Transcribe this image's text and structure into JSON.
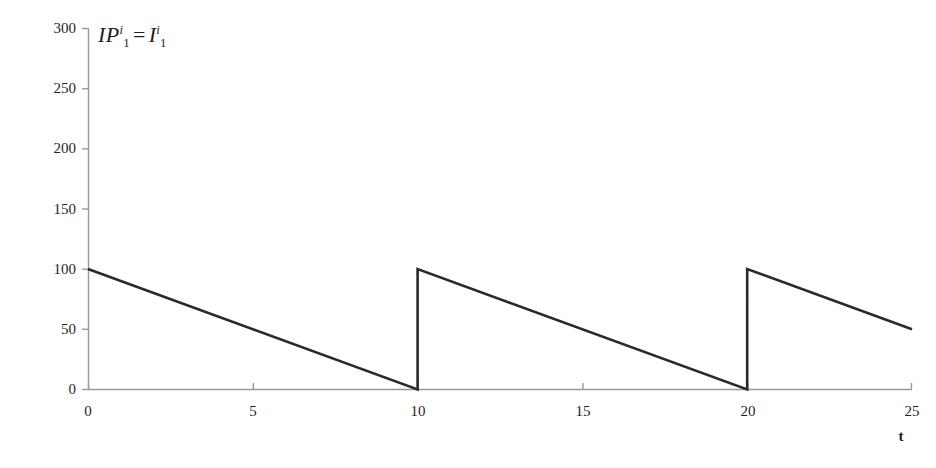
{
  "chart_data": {
    "type": "line",
    "title": "",
    "series_label": {
      "base1": "IP",
      "sup1": "i",
      "sub1": "1",
      "equals": "=",
      "base2": "I",
      "sup2": "i",
      "sub2": "1",
      "plain": "IP_1^i = I_1^i"
    },
    "xlabel": "t",
    "ylabel": "",
    "xlim": [
      0,
      25
    ],
    "ylim": [
      0,
      300
    ],
    "xticks": [
      0,
      5,
      10,
      15,
      20,
      25
    ],
    "xtick_labels": [
      "0",
      "5",
      "10",
      "15",
      "20",
      "25"
    ],
    "yticks": [
      0,
      50,
      100,
      150,
      200,
      250,
      300
    ],
    "ytick_labels": [
      "0",
      "50",
      "100",
      "150",
      "200",
      "250",
      "300"
    ],
    "grid": false,
    "legend": "none",
    "line_color": "#2a2a2a",
    "axis_color": "#999999",
    "background_color": "#ffffff",
    "series": [
      {
        "name": "IP_1^i = I_1^i",
        "points": [
          {
            "x": 0,
            "y": 100
          },
          {
            "x": 10,
            "y": 0
          },
          {
            "x": 10,
            "y": 100
          },
          {
            "x": 20,
            "y": 0
          },
          {
            "x": 20,
            "y": 100
          },
          {
            "x": 25,
            "y": 50
          }
        ]
      }
    ],
    "cycle_length": 10,
    "order_quantity": 100,
    "demand_rate": 10,
    "reorder_points": [
      10,
      20
    ]
  }
}
